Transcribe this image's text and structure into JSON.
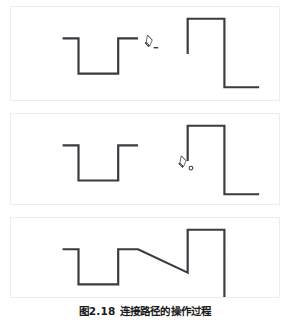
{
  "figure": {
    "caption_number": "图2.18",
    "caption_text": "连接路径的操作过程",
    "caption_full": "图2.18  连接路径的操作过程",
    "stroke_color": "#3a3a42",
    "border_color": "#ededed",
    "background_color": "#ffffff",
    "stroke_width": 2.2
  },
  "panels": [
    {
      "id": "panel-1",
      "name": "step-1-hover-open-endpoint",
      "label": "第一步：指针悬停在左侧路径的开放端点",
      "cursor": {
        "name": "pen-tool-cursor",
        "x": 144,
        "y": 38,
        "visible": true
      },
      "paths": [
        {
          "name": "left-open-path",
          "points": "52,32 68,32 68,68 108,68 108,32 128,32"
        },
        {
          "name": "right-open-path",
          "points": "178,48 178,12 215,12 215,82 250,82"
        }
      ]
    },
    {
      "id": "panel-2",
      "name": "step-2-click-target-endpoint",
      "label": "第二步：单击右侧路径的开放端点",
      "cursor": {
        "name": "pen-tool-cursor",
        "x": 176,
        "y": 50,
        "visible": true
      },
      "paths": [
        {
          "name": "left-open-path",
          "points": "52,32 68,32 68,68 108,68 108,32 128,32"
        },
        {
          "name": "right-open-path",
          "points": "178,48 178,12 215,12 215,82 250,82"
        }
      ]
    },
    {
      "id": "panel-3",
      "name": "step-3-paths-connected",
      "label": "第三步：两条路径已连接",
      "cursor": {
        "name": "pen-tool-cursor",
        "x": 0,
        "y": 0,
        "visible": false
      },
      "paths": [
        {
          "name": "connected-path",
          "points": "52,32 68,32 68,68 108,68 108,32 128,32 178,56 178,12 215,12 215,82 250,82"
        }
      ]
    }
  ]
}
